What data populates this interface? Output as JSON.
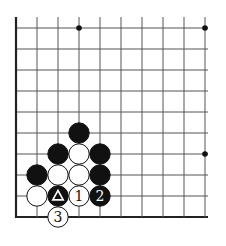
{
  "diagram": {
    "type": "go-board-fragment",
    "colors": {
      "background": "#ffffff",
      "grid_line": "#555555",
      "edge_line": "#222222",
      "black_stone": "#111111",
      "white_stone": "#ffffff",
      "star_point": "#111111"
    },
    "grid": {
      "origin_x": 16,
      "origin_y": 28,
      "spacing": 21,
      "cols": 10,
      "rows": 10,
      "right_extent": 208,
      "top_extent": 17,
      "left_edge_thick": true,
      "bottom_edge_thick": true
    },
    "star_points": [
      {
        "col": 3,
        "row": 0
      },
      {
        "col": 9,
        "row": 0
      },
      {
        "col": 9,
        "row": 6
      }
    ],
    "stones": [
      {
        "col": 3,
        "row": 5,
        "color": "black",
        "label": ""
      },
      {
        "col": 2,
        "row": 6,
        "color": "black",
        "label": ""
      },
      {
        "col": 3,
        "row": 6,
        "color": "white",
        "label": ""
      },
      {
        "col": 4,
        "row": 6,
        "color": "black",
        "label": ""
      },
      {
        "col": 1,
        "row": 7,
        "color": "black",
        "label": ""
      },
      {
        "col": 2,
        "row": 7,
        "color": "white",
        "label": ""
      },
      {
        "col": 3,
        "row": 7,
        "color": "white",
        "label": ""
      },
      {
        "col": 4,
        "row": 7,
        "color": "black",
        "label": ""
      },
      {
        "col": 1,
        "row": 8,
        "color": "white",
        "label": ""
      },
      {
        "col": 2,
        "row": 8,
        "color": "black",
        "label": "triangle",
        "marker": "triangle"
      },
      {
        "col": 3,
        "row": 8,
        "color": "white",
        "label": "1"
      },
      {
        "col": 4,
        "row": 8,
        "color": "black",
        "label": "2"
      },
      {
        "col": 2,
        "row": 9,
        "color": "white",
        "label": "3"
      }
    ]
  }
}
